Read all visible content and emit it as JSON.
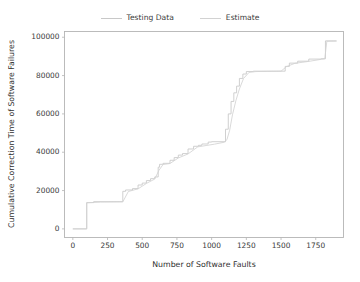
{
  "chart_data": {
    "type": "line",
    "title": "",
    "xlabel": "Number of Software Faults",
    "ylabel": "Cumulative Correction Time of Software Failures",
    "xlim": [
      -60,
      1950
    ],
    "ylim": [
      -4500,
      103000
    ],
    "xticks": [
      0,
      250,
      500,
      750,
      1000,
      1250,
      1500,
      1750
    ],
    "xtick_labels": [
      "0",
      "250",
      "500",
      "750",
      "1000",
      "1250",
      "1500",
      "1750"
    ],
    "yticks": [
      0,
      20000,
      40000,
      60000,
      80000,
      100000
    ],
    "ytick_labels": [
      "0",
      "20000",
      "40000",
      "60000",
      "80000",
      "100000"
    ],
    "grid": false,
    "legend_position": "upper center outside",
    "line_color": "#c8c8c8",
    "estimate_color": "#d2d2d2",
    "series": [
      {
        "name": "Testing Data",
        "style": "step",
        "color": "#c8c8c8",
        "x": [
          0,
          100,
          100,
          150,
          150,
          360,
          360,
          380,
          380,
          430,
          430,
          470,
          470,
          500,
          500,
          530,
          530,
          560,
          560,
          590,
          590,
          615,
          615,
          625,
          625,
          650,
          650,
          700,
          700,
          730,
          730,
          760,
          760,
          790,
          790,
          830,
          830,
          870,
          870,
          905,
          905,
          930,
          930,
          975,
          975,
          1000,
          1000,
          1100,
          1100,
          1120,
          1120,
          1140,
          1140,
          1160,
          1160,
          1180,
          1180,
          1200,
          1200,
          1225,
          1225,
          1250,
          1250,
          1300,
          1300,
          1530,
          1530,
          1560,
          1560,
          1620,
          1620,
          1700,
          1700,
          1790,
          1790,
          1820,
          1820,
          1900
        ],
        "y": [
          0,
          0,
          13700,
          13700,
          14200,
          14200,
          19600,
          19600,
          20300,
          20300,
          21000,
          21000,
          22900,
          22900,
          23900,
          23900,
          25200,
          25200,
          26200,
          26200,
          27100,
          27100,
          32200,
          32200,
          33700,
          33700,
          34200,
          34200,
          35800,
          35800,
          37200,
          37200,
          38500,
          38500,
          39300,
          39300,
          41700,
          41700,
          43100,
          43100,
          43600,
          43600,
          44300,
          44300,
          45300,
          45300,
          45500,
          45500,
          52000,
          52000,
          60000,
          60000,
          66500,
          66500,
          71000,
          71000,
          74500,
          74500,
          78500,
          78500,
          80800,
          80800,
          82100,
          82100,
          82300,
          82300,
          84800,
          84800,
          86500,
          86500,
          87500,
          87500,
          88600,
          88600,
          88800,
          88800,
          98100,
          98100
        ]
      },
      {
        "name": "Estimate",
        "style": "smooth",
        "color": "#d2d2d2",
        "x": [
          0,
          100,
          100,
          200,
          360,
          400,
          470,
          530,
          590,
          620,
          650,
          700,
          760,
          830,
          900,
          960,
          1020,
          1090,
          1110,
          1130,
          1150,
          1175,
          1200,
          1230,
          1270,
          1320,
          1400,
          1500,
          1540,
          1600,
          1700,
          1790,
          1815,
          1830,
          1900
        ],
        "y": [
          0,
          0,
          13600,
          14000,
          14100,
          19500,
          20900,
          23700,
          26000,
          30500,
          33600,
          34100,
          37000,
          39100,
          42800,
          43500,
          44200,
          45200,
          46500,
          51500,
          59500,
          67000,
          73000,
          78500,
          81700,
          82100,
          82200,
          82300,
          84700,
          86400,
          87400,
          88500,
          88700,
          97900,
          98000
        ]
      }
    ]
  },
  "legend": {
    "entries": [
      {
        "label": "Testing Data",
        "color": "#c8c8c8"
      },
      {
        "label": "Estimate",
        "color": "#d2d2d2"
      }
    ]
  }
}
